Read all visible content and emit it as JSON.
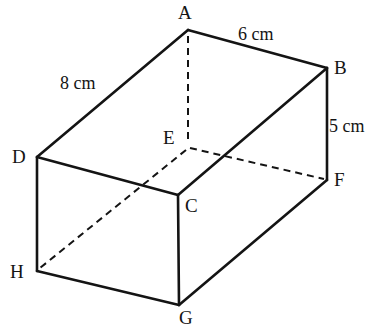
{
  "figure": {
    "type": "cuboid-net-diagram",
    "stroke_color": "#141414",
    "background_color": "#ffffff",
    "solid_stroke_width": 2.6,
    "dashed_stroke_width": 2.0,
    "dash_pattern": "7,5",
    "vertices": [
      {
        "name": "A",
        "x": 188,
        "y": 30,
        "label": "A",
        "label_x": 178,
        "label_y": 3,
        "hidden": false
      },
      {
        "name": "B",
        "x": 327,
        "y": 68,
        "label": "B",
        "label_x": 334,
        "label_y": 58,
        "hidden": false
      },
      {
        "name": "C",
        "x": 178,
        "y": 195,
        "label": "C",
        "label_x": 185,
        "label_y": 196,
        "hidden": false
      },
      {
        "name": "D",
        "x": 37,
        "y": 157,
        "label": "D",
        "label_x": 12,
        "label_y": 147,
        "hidden": false
      },
      {
        "name": "E",
        "x": 188,
        "y": 147,
        "label": "E",
        "label_x": 163,
        "label_y": 128,
        "hidden": true
      },
      {
        "name": "F",
        "x": 327,
        "y": 180,
        "label": "F",
        "label_x": 334,
        "label_y": 170,
        "hidden": false
      },
      {
        "name": "G",
        "x": 179,
        "y": 305,
        "label": "G",
        "label_x": 179,
        "label_y": 308,
        "hidden": false
      },
      {
        "name": "H",
        "x": 37,
        "y": 271,
        "label": "H",
        "label_x": 10,
        "label_y": 262,
        "hidden": false
      }
    ],
    "solid_edges": [
      {
        "id": "A-B",
        "from": "A",
        "to": "B"
      },
      {
        "id": "A-D",
        "from": "A",
        "to": "D"
      },
      {
        "id": "B-C",
        "from": "B",
        "to": "C"
      },
      {
        "id": "B-F",
        "from": "B",
        "to": "F"
      },
      {
        "id": "D-C",
        "from": "D",
        "to": "C"
      },
      {
        "id": "D-H",
        "from": "D",
        "to": "H"
      },
      {
        "id": "C-G",
        "from": "C",
        "to": "G"
      },
      {
        "id": "H-G",
        "from": "H",
        "to": "G"
      },
      {
        "id": "G-F",
        "from": "G",
        "to": "F"
      }
    ],
    "dashed_edges": [
      {
        "id": "A-E",
        "from": "A",
        "to": "E"
      },
      {
        "id": "E-F",
        "from": "E",
        "to": "F"
      },
      {
        "id": "E-H",
        "from": "E",
        "to": "H"
      }
    ],
    "dimensions": [
      {
        "id": "len-6cm",
        "text": "6 cm",
        "edge": "A-B",
        "x": 238,
        "y": 25
      },
      {
        "id": "len-8cm",
        "text": "8 cm",
        "edge": "A-D",
        "x": 60,
        "y": 74
      },
      {
        "id": "len-5cm",
        "text": "5 cm",
        "edge": "B-F",
        "x": 329,
        "y": 117
      }
    ]
  }
}
